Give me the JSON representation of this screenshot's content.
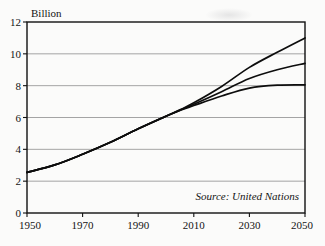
{
  "figure": {
    "background_color": "#fbfbfa",
    "ink_color": "#0d0d0d",
    "grid_color": "#8e8e8e",
    "y_axis_title": "Billion",
    "source_note": "Source: United Nations"
  },
  "chart_data": {
    "type": "line",
    "title": "",
    "subtitle": "",
    "xlabel": "",
    "ylabel": "Billion",
    "xlim": [
      1950,
      2050
    ],
    "ylim": [
      0,
      12
    ],
    "grid": true,
    "grid_axis": "y",
    "legend": "none",
    "annotations": [
      {
        "text": "Source: United Nations",
        "position": "inside-bottom-right",
        "style": "italic"
      }
    ],
    "y_ticks": [
      0,
      2,
      4,
      6,
      8,
      10,
      12
    ],
    "y_tick_labels": [
      "0",
      "2",
      "4",
      "6",
      "8",
      "10",
      "12"
    ],
    "x_ticks": [
      1950,
      1970,
      1990,
      2010,
      2030,
      2050
    ],
    "x_tick_labels": [
      "1950",
      "1970",
      "1990",
      "2010",
      "2030",
      "2050"
    ],
    "x": [
      1950,
      1960,
      1970,
      1980,
      1990,
      2000,
      2005,
      2010,
      2020,
      2030,
      2040,
      2050
    ],
    "series": [
      {
        "name": "High variant",
        "values": [
          2.55,
          3.02,
          3.69,
          4.44,
          5.29,
          6.08,
          6.48,
          6.92,
          7.95,
          9.15,
          10.1,
          11.0
        ]
      },
      {
        "name": "Medium variant",
        "values": [
          2.55,
          3.02,
          3.69,
          4.44,
          5.29,
          6.08,
          6.46,
          6.83,
          7.62,
          8.45,
          9.0,
          9.4
        ]
      },
      {
        "name": "Low variant",
        "values": [
          2.55,
          3.02,
          3.69,
          4.44,
          5.29,
          6.08,
          6.44,
          6.75,
          7.35,
          7.85,
          8.03,
          8.05
        ]
      }
    ]
  }
}
